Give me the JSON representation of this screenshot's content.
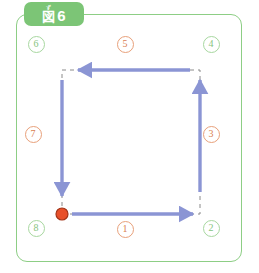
{
  "figure": {
    "tab": {
      "ruby": "ず",
      "kanji": "図",
      "number": "6",
      "full_label": "図6",
      "background_color": "#7cc576",
      "text_color": "#ffffff"
    },
    "card": {
      "border_color": "#8dce85",
      "background_color": "#ffffff"
    }
  },
  "diagram": {
    "type": "path-route-square",
    "start_marker": {
      "name": "start-point",
      "shape": "circle",
      "fill_color": "#e8502a",
      "stroke_color": "#a33418",
      "x": 62,
      "y": 214,
      "radius": 6
    },
    "dashed_path": {
      "color": "#8a8a8a",
      "dash": "4 4",
      "corners": [
        {
          "label": "bottom-left",
          "x": 62,
          "y": 214
        },
        {
          "label": "bottom-right",
          "x": 200,
          "y": 214
        },
        {
          "label": "top-right",
          "x": 200,
          "y": 70
        },
        {
          "label": "top-left",
          "x": 62,
          "y": 70
        }
      ]
    },
    "arrows": [
      {
        "name": "arrow-segment-1",
        "direction": "right",
        "color": "#8b95d4",
        "x1": 72,
        "y1": 214,
        "x2": 193,
        "y2": 214
      },
      {
        "name": "arrow-segment-3",
        "direction": "up",
        "color": "#8b95d4",
        "x1": 200,
        "y1": 192,
        "x2": 200,
        "y2": 80
      },
      {
        "name": "arrow-segment-5",
        "direction": "left",
        "color": "#8b95d4",
        "x1": 190,
        "y1": 70,
        "x2": 78,
        "y2": 70
      },
      {
        "name": "arrow-segment-7",
        "direction": "down",
        "color": "#8b95d4",
        "x1": 62,
        "y1": 80,
        "x2": 62,
        "y2": 196
      }
    ],
    "steps": [
      {
        "id": "1",
        "label": "①",
        "kind": "segment",
        "color_role": "orange",
        "x": 125,
        "y": 229
      },
      {
        "id": "2",
        "label": "②",
        "kind": "corner",
        "color_role": "green",
        "x": 211,
        "y": 228
      },
      {
        "id": "3",
        "label": "③",
        "kind": "segment",
        "color_role": "orange",
        "x": 211,
        "y": 134
      },
      {
        "id": "4",
        "label": "④",
        "kind": "corner",
        "color_role": "green",
        "x": 211,
        "y": 44
      },
      {
        "id": "5",
        "label": "⑤",
        "kind": "segment",
        "color_role": "orange",
        "x": 125,
        "y": 44
      },
      {
        "id": "6",
        "label": "⑥",
        "kind": "corner",
        "color_role": "green",
        "x": 36,
        "y": 44
      },
      {
        "id": "7",
        "label": "⑦",
        "kind": "segment",
        "color_role": "orange",
        "x": 33,
        "y": 134
      },
      {
        "id": "8",
        "label": "⑧",
        "kind": "corner",
        "color_role": "green",
        "x": 36,
        "y": 228
      }
    ],
    "colors": {
      "arrow": "#8b95d4",
      "dash": "#8a8a8a",
      "step_orange": "#d98050",
      "step_green": "#86c47e",
      "start_dot": "#e8502a"
    }
  }
}
